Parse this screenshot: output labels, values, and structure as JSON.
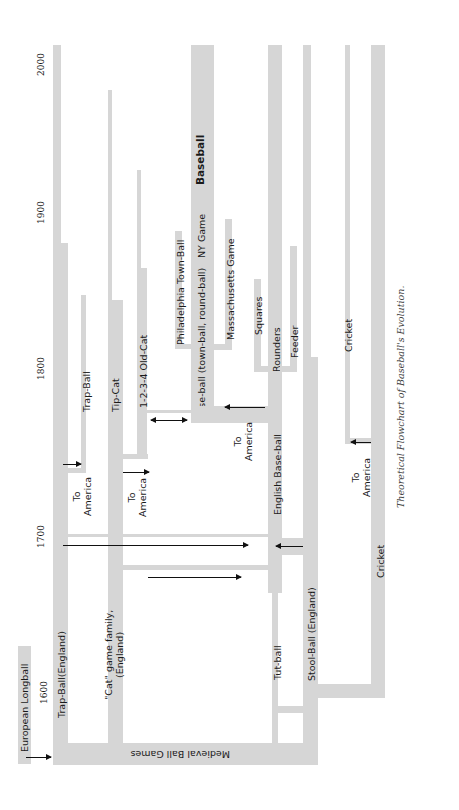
{
  "diagram": {
    "caption": "Theoretical Flowchart of Baseball's Evolution.",
    "orientation": "rotated 90° counter-clockwise (time runs bottom-to-top)",
    "years": [
      "1600",
      "1700",
      "1800",
      "1900",
      "2000"
    ],
    "nodes": {
      "european_longball": "European Longball",
      "medieval_ball_games": "Medieval Ball Games",
      "trap_ball_england": "Trap-Ball(England)",
      "cat_family": "\"Cat\" game family,",
      "cat_family_2": "(England)",
      "trap_ball": "Trap-Ball",
      "tip_cat": "Tip-Cat",
      "old_cat": "1-2-3-4 Old-Cat",
      "base_ball": "Base-ball (town-ball, round-ball)",
      "philadelphia_town_ball": "Philadelphia Town-Ball",
      "ny_game": "NY Game",
      "baseball": "Baseball",
      "massachusetts_game": "Massachusetts Game",
      "english_base_ball": "English Base-ball",
      "squares": "Squares",
      "rounders": "Rounders",
      "feeder": "Feeder",
      "tut_ball": "Tut-ball",
      "stool_ball": "Stool-Ball (England)",
      "cricket": "Cricket",
      "cricket_america": "Cricket"
    },
    "annotations": {
      "to": "To",
      "america": "America"
    },
    "colors": {
      "bar": "#d6d6d6",
      "arrow": "#111111",
      "text": "#1a1a1a"
    }
  }
}
